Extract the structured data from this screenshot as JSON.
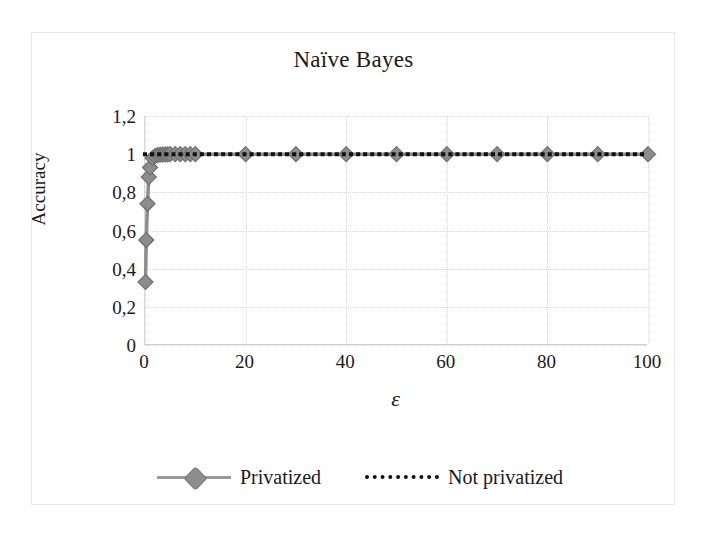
{
  "chart_data": {
    "type": "line",
    "title": "Naïve Bayes",
    "xlabel": "ε",
    "ylabel": "Accuracy",
    "xlim": [
      0,
      100
    ],
    "ylim": [
      0,
      1.2
    ],
    "grid": true,
    "legend_position": "bottom",
    "xticks": [
      "0",
      "20",
      "40",
      "60",
      "80",
      "100"
    ],
    "xtick_values": [
      0,
      20,
      40,
      60,
      80,
      100
    ],
    "yticks": [
      "0",
      "0,2",
      "0,4",
      "0,6",
      "0,8",
      "1",
      "1,2"
    ],
    "ytick_values": [
      0,
      0.2,
      0.4,
      0.6,
      0.8,
      1.0,
      1.2
    ],
    "series": [
      {
        "name": "Privatized",
        "style": "line-marker",
        "color": "#8d8d8d",
        "marker": "diamond",
        "x": [
          0.1,
          0.25,
          0.5,
          0.75,
          1,
          1.5,
          2,
          2.5,
          3,
          3.5,
          4,
          4.5,
          5,
          6,
          7,
          8,
          9,
          10,
          20,
          30,
          40,
          50,
          60,
          70,
          80,
          90,
          100
        ],
        "values": [
          0.33,
          0.55,
          0.74,
          0.88,
          0.93,
          0.98,
          0.99,
          0.995,
          0.997,
          0.998,
          0.999,
          0.999,
          1.0,
          1.0,
          1.0,
          1.0,
          1.0,
          1.0,
          1.0,
          1.0,
          1.0,
          1.0,
          1.0,
          1.0,
          1.0,
          1.0,
          1.0
        ]
      },
      {
        "name": "Not privatized",
        "style": "dotted",
        "color": "#111111",
        "marker": "none",
        "x": [
          0,
          100
        ],
        "values": [
          1.0,
          1.0
        ]
      }
    ]
  },
  "legend": {
    "entries": [
      {
        "label": "Privatized"
      },
      {
        "label": "Not privatized"
      }
    ]
  }
}
